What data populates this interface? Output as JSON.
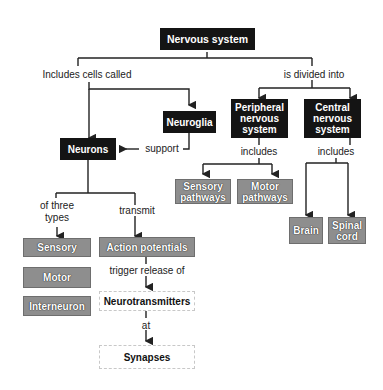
{
  "diagram": {
    "root": "Nervous system",
    "links": {
      "includes_cells": "Includes cells called",
      "divided_into": "is divided into",
      "support": "support",
      "of_three_types_1": "of three",
      "of_three_types_2": "types",
      "transmit": "transmit",
      "includes_pns": "includes",
      "includes_cns": "includes",
      "trigger_release": "trigger release of",
      "at": "at"
    },
    "nodes": {
      "neurons": "Neurons",
      "neuroglia": "Neuroglia",
      "pns_1": "Peripheral",
      "pns_2": "nervous",
      "pns_3": "system",
      "cns_1": "Central",
      "cns_2": "nervous",
      "cns_3": "system",
      "sensory_pathways_1": "Sensory",
      "sensory_pathways_2": "pathways",
      "motor_pathways_1": "Motor",
      "motor_pathways_2": "pathways",
      "brain": "Brain",
      "spinal_1": "Spinal",
      "spinal_2": "cord",
      "sensory": "Sensory",
      "motor": "Motor",
      "interneuron": "Interneuron",
      "action_potentials": "Action potentials",
      "neurotransmitters": "Neurotransmitters",
      "synapses": "Synapses"
    },
    "colors": {
      "dark_box": "#141414",
      "gray_box": "#8e8e8e",
      "line": "#222222"
    }
  }
}
